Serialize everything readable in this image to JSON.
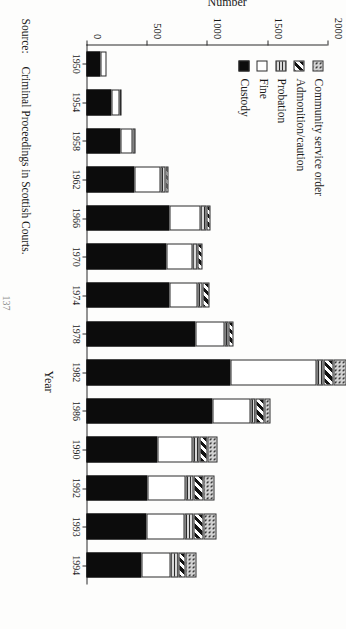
{
  "chart_data": {
    "type": "bar",
    "subtype": "stacked-horizontal-scan",
    "title": "",
    "xlabel": "Year",
    "ylabel": "Number",
    "ylim": [
      0,
      2000
    ],
    "yticks": [
      0,
      500,
      1000,
      1500,
      2000
    ],
    "ytick_labels": [
      "0",
      "500",
      "1000",
      "1500",
      "2000"
    ],
    "grid": false,
    "legend_position": "top-left",
    "categories": [
      "1950",
      "1954",
      "1958",
      "1962",
      "1966",
      "1970",
      "1974",
      "1978",
      "1982",
      "1986",
      "1990",
      "1992",
      "1993",
      "1994"
    ],
    "series": [
      {
        "name": "Custody",
        "pattern": "solid-black",
        "values": [
          118,
          205,
          280,
          400,
          690,
          660,
          690,
          905,
          1195,
          1045,
          590,
          510,
          500,
          455
        ]
      },
      {
        "name": "Fine",
        "pattern": "white",
        "values": [
          48,
          70,
          105,
          215,
          255,
          220,
          230,
          240,
          715,
          315,
          290,
          310,
          315,
          240
        ]
      },
      {
        "name": "Probation",
        "pattern": "horizontal-lines",
        "values": [
          0,
          12,
          22,
          40,
          50,
          45,
          45,
          35,
          55,
          40,
          55,
          65,
          70,
          65
        ]
      },
      {
        "name": "Admonition/caution",
        "pattern": "diagonal-hatch",
        "values": [
          0,
          0,
          0,
          22,
          35,
          35,
          55,
          40,
          85,
          75,
          70,
          90,
          90,
          60
        ]
      },
      {
        "name": "Community service order",
        "pattern": "stipple",
        "values": [
          0,
          0,
          0,
          0,
          0,
          0,
          0,
          0,
          105,
          55,
          85,
          85,
          105,
          90
        ]
      }
    ],
    "legend": [
      {
        "label": "Community service order",
        "swatch": "stipple"
      },
      {
        "label": "Admonition/caution",
        "swatch": "diagonal-hatch"
      },
      {
        "label": "Probation",
        "swatch": "horizontal-lines"
      },
      {
        "label": "Fine",
        "swatch": "white"
      },
      {
        "label": "Custody",
        "swatch": "solid-black"
      }
    ]
  },
  "source": {
    "key": "Source:",
    "text": "Criminal Proceedings in Scottish Courts."
  },
  "page_number": "137",
  "colors": {
    "ink": "#1a1a1a",
    "axis": "#2b2b2b",
    "paper": "#fdfdfc",
    "custody": "#0c0c0c",
    "fine": "#ffffff",
    "probation": "#d9d9d9"
  }
}
